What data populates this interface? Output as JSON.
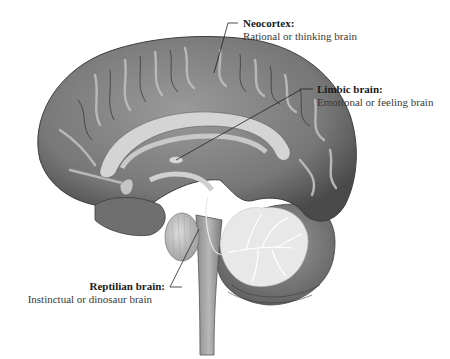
{
  "figure": {
    "labels": [
      {
        "id": "neocortex",
        "title": "Neocortex:",
        "description": "Rational or thinking brain"
      },
      {
        "id": "limbic",
        "title": "Limbic brain:",
        "description": "Emotional or feeling brain"
      },
      {
        "id": "reptilian",
        "title": "Reptilian brain:",
        "description": "Instinctual or dinosaur brain"
      }
    ]
  },
  "colors": {
    "background": "#ffffff",
    "cortex": "#7d7d7d",
    "cortex_dark": "#4f4f4f",
    "gyri_highlight": "#bdbdbd",
    "white_matter": "#d6d6d6",
    "cerebellum_tree": "#eeeeee",
    "leader_line": "#222222",
    "text": "#2a2a2a"
  }
}
